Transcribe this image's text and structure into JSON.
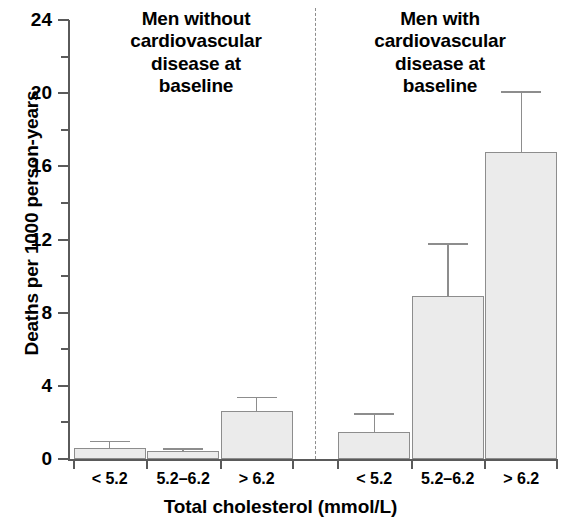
{
  "chart_data": {
    "type": "bar",
    "title": "",
    "xlabel": "Total cholesterol (mmol/L)",
    "ylabel": "Deaths per 1000 person-years",
    "ylim": [
      0,
      24
    ],
    "ytick_major": [
      0,
      4,
      8,
      12,
      16,
      20,
      24
    ],
    "ytick_minor": [
      2,
      6,
      10,
      14,
      18,
      22
    ],
    "grid": false,
    "legend": "none",
    "categories": [
      "< 5.2",
      "5.2–6.2",
      "> 6.2"
    ],
    "panels": [
      {
        "title": "Men without cardiovascular disease at baseline",
        "title_lines": [
          "Men without",
          "cardiovascular",
          "disease at",
          "baseline"
        ],
        "categories": [
          "< 5.2",
          "5.2–6.2",
          "> 6.2"
        ],
        "values": [
          0.6,
          0.45,
          2.6
        ],
        "error_upper": [
          1.0,
          0.6,
          3.4
        ]
      },
      {
        "title": "Men with cardiovascular disease at baseline",
        "title_lines": [
          "Men with",
          "cardiovascular",
          "disease at",
          "baseline"
        ],
        "categories": [
          "< 5.2",
          "5.2–6.2",
          "> 6.2"
        ],
        "values": [
          1.5,
          8.9,
          16.8
        ],
        "error_upper": [
          2.5,
          11.8,
          20.1
        ]
      }
    ],
    "series": [
      {
        "name": "Men without cardiovascular disease at baseline",
        "values": [
          0.6,
          0.45,
          2.6
        ]
      },
      {
        "name": "Men with cardiovascular disease at baseline",
        "values": [
          1.5,
          8.9,
          16.8
        ]
      }
    ],
    "colors": {
      "bar_fill": "#ebebeb",
      "bar_border": "#8d8d8d",
      "axis": "#5a5a5a",
      "text": "#000000",
      "divider": "#8d8d8d"
    }
  },
  "axes": {
    "y_title": "Deaths per 1000 person-years",
    "x_title": "Total cholesterol (mmol/L)",
    "y_labels": [
      "24",
      "20",
      "16",
      "12",
      "8",
      "4",
      "0"
    ]
  }
}
